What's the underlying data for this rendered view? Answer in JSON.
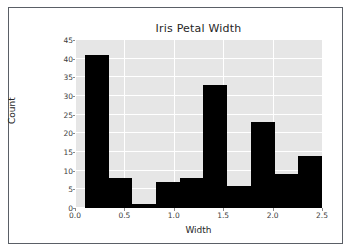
{
  "figure": {
    "background": "#ffffff",
    "border_color": "#5a5f66",
    "plot_background": "#e6e6e6",
    "grid_color": "#ffffff",
    "bar_color": "#000000",
    "text_color": "#262626"
  },
  "chart_data": {
    "type": "bar",
    "title": "Iris Petal Width",
    "xlabel": "Width",
    "ylabel": "Count",
    "bin_edges": [
      0.1,
      0.34,
      0.58,
      0.82,
      1.06,
      1.3,
      1.54,
      1.78,
      2.02,
      2.26,
      2.5
    ],
    "categories": [
      "0.1-0.34",
      "0.34-0.58",
      "0.58-0.82",
      "0.82-1.06",
      "1.06-1.3",
      "1.3-1.54",
      "1.54-1.78",
      "1.78-2.02",
      "2.02-2.26",
      "2.26-2.5"
    ],
    "values": [
      41,
      8,
      1,
      7,
      8,
      33,
      6,
      23,
      9,
      14
    ],
    "xlim": [
      0.0,
      2.5
    ],
    "ylim": [
      0,
      45
    ],
    "xticks": [
      "0.0",
      "0.5",
      "1.0",
      "1.5",
      "2.0",
      "2.5"
    ],
    "xtick_values": [
      0.0,
      0.5,
      1.0,
      1.5,
      2.0,
      2.5
    ],
    "yticks": [
      "0",
      "5",
      "10",
      "15",
      "20",
      "25",
      "30",
      "35",
      "40",
      "45"
    ],
    "ytick_values": [
      0,
      5,
      10,
      15,
      20,
      25,
      30,
      35,
      40,
      45
    ],
    "grid": true,
    "legend": null
  }
}
